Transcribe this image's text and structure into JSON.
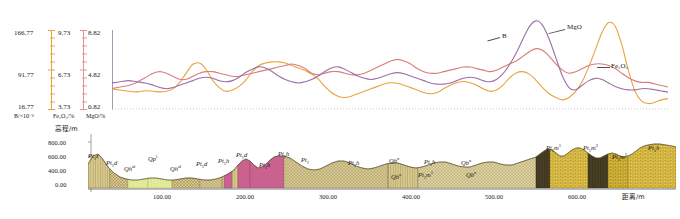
{
  "figure": {
    "title": "",
    "panels": [
      "geochemical-profile",
      "geological-cross-section"
    ]
  },
  "top_panel": {
    "axes": [
      {
        "id": "B",
        "unit_label": "B/×10⁻⁶",
        "color": "#e8a33d",
        "ticks": [
          "166.77",
          "91.77",
          "16.77"
        ],
        "top": "166.77",
        "mid": "91.77",
        "bottom": "16.77"
      },
      {
        "id": "Fe2O3",
        "unit_label": "Fe₂O₃/%",
        "color": "#e98f8f",
        "ticks": [
          "9.73",
          "6.73",
          "3.73"
        ],
        "top": "9.73",
        "mid": "6.73",
        "bottom": "3.73"
      },
      {
        "id": "MgO",
        "unit_label": "MgO/%",
        "color": "#9b6fa8",
        "ticks": [
          "8.82",
          "4.82",
          "0.82"
        ],
        "top": "8.82",
        "mid": "4.82",
        "bottom": "0.82"
      }
    ],
    "curve_labels": [
      {
        "name": "B",
        "text": "B"
      },
      {
        "name": "MgO",
        "text": "MgO"
      },
      {
        "name": "Fe2O3",
        "text": "Fe₂O₃"
      }
    ]
  },
  "bottom_panel": {
    "y_axis_title": "高程/m",
    "y_ticks": [
      "800.00",
      "600.00",
      "400.00",
      "0.00"
    ],
    "x_axis_title": "距离/m",
    "x_ticks": [
      "100.00",
      "200.00",
      "300.00",
      "400.00",
      "500.00",
      "600.00"
    ],
    "unit_labels": [
      {
        "text": "Pt₁z"
      },
      {
        "text": "Pt₁d"
      },
      {
        "text": "Qh^al"
      },
      {
        "text": "Qp^l"
      },
      {
        "text": "Qh^al"
      },
      {
        "text": "Pt₁d"
      },
      {
        "text": "Pt₁h"
      },
      {
        "text": "Pt₁d"
      },
      {
        "text": "Pt₁h"
      },
      {
        "text": "Pt₁"
      },
      {
        "text": "Pt₁h"
      },
      {
        "text": "Qb^n"
      },
      {
        "text": "Pt₁h"
      },
      {
        "text": "Qb^n"
      },
      {
        "text": "Qb^n"
      },
      {
        "text": "Pt₁m¹"
      },
      {
        "text": "Qb^n"
      },
      {
        "text": "Pt₁m¹"
      },
      {
        "text": "Pt₁m²"
      },
      {
        "text": "Pt₁m¹"
      },
      {
        "text": "Pt₁h"
      }
    ]
  },
  "chart_data": {
    "type": "line",
    "title": "",
    "xlabel": "距离/m",
    "ylabel": "",
    "grid": false,
    "legend": "inline-annotations",
    "xlim": [
      0,
      680
    ],
    "series": [
      {
        "name": "B",
        "label": "B",
        "color": "#e8a33d",
        "unit": "×10⁻⁶",
        "axis_ticks": [
          16.77,
          91.77,
          166.77
        ],
        "ylim": [
          16.77,
          166.77
        ],
        "x": [
          0,
          10,
          20,
          30,
          40,
          50,
          58,
          66,
          74,
          82,
          90,
          98,
          106,
          114,
          122,
          130,
          138,
          146,
          154,
          162,
          170,
          178,
          186,
          194,
          202,
          210,
          218,
          226,
          234,
          242,
          250,
          258,
          266,
          274,
          282,
          290,
          298,
          306,
          314,
          322,
          330,
          338,
          346,
          354,
          362,
          370,
          378,
          386,
          394,
          402,
          410,
          418,
          426,
          434,
          442,
          450,
          458,
          466,
          474,
          482,
          490,
          498,
          506,
          514,
          522,
          530,
          538,
          546,
          554,
          562,
          570,
          578,
          586,
          594,
          602,
          610,
          618,
          626,
          634,
          642,
          650,
          658,
          666,
          674
        ],
        "y": [
          48,
          46,
          44,
          43,
          45,
          44,
          43,
          44,
          48,
          58,
          74,
          88,
          90,
          80,
          62,
          50,
          44,
          46,
          52,
          62,
          76,
          86,
          90,
          92,
          92,
          90,
          86,
          82,
          78,
          72,
          64,
          52,
          42,
          36,
          34,
          36,
          40,
          44,
          48,
          52,
          56,
          58,
          57,
          54,
          50,
          46,
          42,
          40,
          42,
          48,
          54,
          58,
          60,
          58,
          54,
          48,
          44,
          46,
          54,
          66,
          74,
          76,
          72,
          62,
          50,
          40,
          34,
          30,
          34,
          44,
          60,
          84,
          112,
          140,
          156,
          150,
          120,
          78,
          44,
          28,
          24,
          26,
          30,
          32
        ]
      },
      {
        "name": "Fe2O3",
        "label": "Fe₂O₃",
        "color": "#dd7b7b",
        "unit": "%",
        "axis_ticks": [
          3.73,
          6.73,
          9.73
        ],
        "ylim": [
          3.73,
          9.73
        ],
        "x": [
          0,
          10,
          20,
          30,
          40,
          50,
          58,
          66,
          74,
          82,
          90,
          98,
          106,
          114,
          122,
          130,
          138,
          146,
          154,
          162,
          170,
          178,
          186,
          194,
          202,
          210,
          218,
          226,
          234,
          242,
          250,
          258,
          266,
          274,
          282,
          290,
          298,
          306,
          314,
          322,
          330,
          338,
          346,
          354,
          362,
          370,
          378,
          386,
          394,
          402,
          410,
          418,
          426,
          434,
          442,
          450,
          458,
          466,
          474,
          482,
          490,
          498,
          506,
          514,
          522,
          530,
          538,
          546,
          554,
          562,
          570,
          578,
          586,
          594,
          602,
          610,
          618,
          626,
          634,
          642,
          650,
          658,
          666,
          674
        ],
        "y": [
          5.0,
          5.1,
          5.2,
          5.4,
          5.7,
          6.0,
          6.1,
          6.0,
          5.8,
          5.6,
          5.6,
          5.8,
          6.0,
          6.1,
          6.1,
          6.0,
          5.9,
          5.8,
          5.8,
          5.9,
          6.0,
          6.1,
          6.2,
          6.3,
          6.4,
          6.5,
          6.6,
          6.5,
          6.3,
          6.0,
          5.9,
          6.0,
          6.1,
          6.1,
          6.0,
          5.9,
          5.9,
          6.0,
          6.2,
          6.4,
          6.6,
          6.8,
          6.9,
          6.8,
          6.6,
          6.3,
          6.1,
          6.0,
          6.0,
          6.1,
          6.2,
          6.3,
          6.4,
          6.4,
          6.3,
          6.2,
          6.1,
          6.2,
          6.4,
          6.6,
          6.8,
          7.1,
          7.4,
          7.6,
          7.5,
          7.1,
          6.6,
          6.2,
          6.0,
          6.1,
          6.3,
          6.5,
          6.6,
          6.6,
          6.5,
          6.3,
          6.0,
          5.7,
          5.5,
          5.4,
          5.4,
          5.3,
          5.2,
          5.1
        ]
      },
      {
        "name": "MgO",
        "label": "MgO",
        "color": "#9b6fa8",
        "unit": "%",
        "axis_ticks": [
          0.82,
          4.82,
          8.82
        ],
        "ylim": [
          0.82,
          8.82
        ],
        "x": [
          0,
          10,
          20,
          30,
          40,
          50,
          58,
          66,
          74,
          82,
          90,
          98,
          106,
          114,
          122,
          130,
          138,
          146,
          154,
          162,
          170,
          178,
          186,
          194,
          202,
          210,
          218,
          226,
          234,
          242,
          250,
          258,
          266,
          274,
          282,
          290,
          298,
          306,
          314,
          322,
          330,
          338,
          346,
          354,
          362,
          370,
          378,
          386,
          394,
          402,
          410,
          418,
          426,
          434,
          442,
          450,
          458,
          466,
          474,
          482,
          490,
          498,
          506,
          514,
          522,
          530,
          538,
          546,
          554,
          562,
          570,
          578,
          586,
          594,
          602,
          610,
          618,
          626,
          634,
          642,
          650,
          658,
          666,
          674
        ],
        "y": [
          3.0,
          3.1,
          3.2,
          3.1,
          3.0,
          2.8,
          2.6,
          2.5,
          2.6,
          2.8,
          3.0,
          3.2,
          3.4,
          3.5,
          3.4,
          3.2,
          3.1,
          3.2,
          3.5,
          3.9,
          4.2,
          4.4,
          4.3,
          4.0,
          3.6,
          3.3,
          3.1,
          3.0,
          3.1,
          3.3,
          3.6,
          4.0,
          4.3,
          4.4,
          4.2,
          3.9,
          3.6,
          3.4,
          3.3,
          3.4,
          3.6,
          3.8,
          3.9,
          3.8,
          3.6,
          3.4,
          3.2,
          3.0,
          2.9,
          2.9,
          3.0,
          3.2,
          3.4,
          3.5,
          3.4,
          3.2,
          3.1,
          3.3,
          3.8,
          4.6,
          5.6,
          6.8,
          7.9,
          8.4,
          8.0,
          6.8,
          5.2,
          3.6,
          2.6,
          2.4,
          2.8,
          3.2,
          3.4,
          3.3,
          3.0,
          2.7,
          2.5,
          2.4,
          2.4,
          2.5,
          2.5,
          2.4,
          2.3,
          2.2
        ]
      }
    ]
  }
}
